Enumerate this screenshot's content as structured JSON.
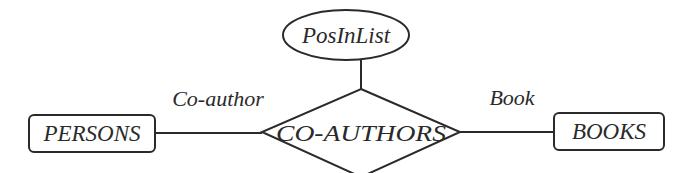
{
  "diagram": {
    "type": "entity-relationship",
    "entities": [
      {
        "id": "persons",
        "label": "PERSONS"
      },
      {
        "id": "books",
        "label": "BOOKS"
      }
    ],
    "relationship": {
      "id": "co-authors",
      "label": "CO-AUTHORS"
    },
    "attribute": {
      "id": "posinlist",
      "label": "PosInList"
    },
    "roles": [
      {
        "id": "co-author",
        "label": "Co-author",
        "connects": [
          "persons",
          "co-authors"
        ]
      },
      {
        "id": "book",
        "label": "Book",
        "connects": [
          "co-authors",
          "books"
        ]
      }
    ],
    "colors": {
      "stroke": "#2a2a2a",
      "background": "#ffffff"
    }
  }
}
